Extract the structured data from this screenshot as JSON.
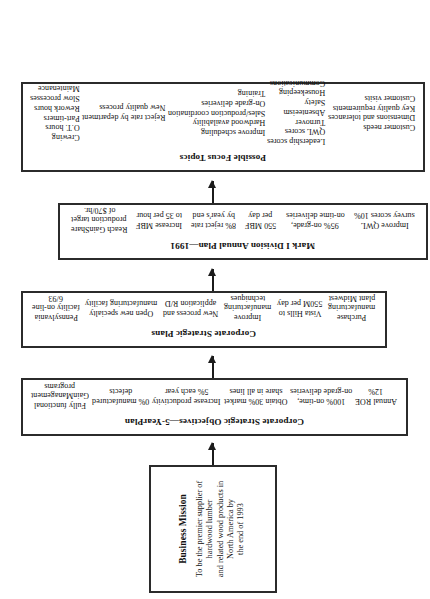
{
  "diagram": {
    "type": "flowchart",
    "orientation": "rotated-90-ccw",
    "nodes": [
      {
        "id": "business-mission",
        "title": "Business Mission",
        "body": "To be the premier supplier of hardwood lumber\nand related wood products in North America by\nthe end of 1993"
      },
      {
        "id": "corporate-strategic-objectives",
        "title": "Corporate Strategic Objectives—5-YearPlan",
        "columns": [
          "Fully functional\nGainManagement\nprograms",
          "0% manufactured\ndefects",
          "Increase productivity\n5% each year",
          "Obtain 30% market\nshare in all lines",
          "100% on-time,\non-grade deliveries",
          "Annual ROE\n12%"
        ]
      },
      {
        "id": "corporate-strategic-plans",
        "title": "Corporate Strategic Plans",
        "columns": [
          "Pennsylvania\nfacility on-line\n6/93",
          "Open new specialty\nmanufacturing facility",
          "New process and\napplication R/D",
          "Improve\nmanufacturing\ntechniques",
          "Vista Hills to\n550M per day",
          "Purchase\nmanufacturing\nplant Midwest"
        ]
      },
      {
        "id": "mark-i-division-annual-plan",
        "title": "Mark I Division Annual Plan—1991",
        "columns": [
          "Reach GainShare\nproduction target\nof $70/hr.",
          "Increase MBF\nto 35 per hour",
          "8% reject rate\nby year's end",
          "550 MBF\nper day",
          "95% on-grade,\non-time deliveries",
          "Improve QWL\nsurvey scores 10%"
        ]
      },
      {
        "id": "possible-focus-topics",
        "title": "Possible Focus Topics",
        "columns": [
          "Crewing\nO.T. hours\nPart-timers\nRework hours\nSlow processes\nMaintenance",
          "Reject rate by department\nNew quality process",
          "Improve scheduling\nHardwood availability\nSales/production coordination\nOn-grade deliveries\nTraining",
          "Leadership scores\nQWL scores\nTurnover\nAbsenteeism\nSafety\nHousekeeping\nCommunications",
          "Customer needs\nDimensions and tolerances\nKey quality requirements\nCustomer visits"
        ]
      }
    ],
    "arrows": [
      {
        "id": "arrow-mission-to-objectives",
        "label": ""
      },
      {
        "id": "arrow-objectives-to-plans",
        "label": ""
      },
      {
        "id": "arrow-plans-to-annual",
        "label": ""
      },
      {
        "id": "arrow-annual-to-focus",
        "label": ""
      }
    ],
    "colors": {
      "background": "#ffffff",
      "border": "#2b2b2b",
      "text": "#111111",
      "arrow": "#1b1b1b"
    }
  }
}
